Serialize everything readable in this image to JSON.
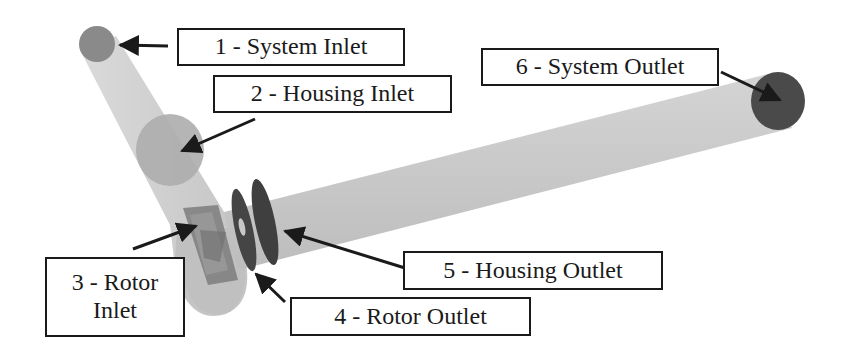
{
  "figure": {
    "type": "annotated 3D flow-domain rendering",
    "colors": {
      "background": "#ffffff",
      "pipe_fill": "#c9c9c9",
      "pipe_shadow": "#b5b5b5",
      "inlet_disc": "#8a8a8a",
      "housing_inlet_disc": "#a8a8a8",
      "outlet_disc": "#4a4a4a",
      "rotor_disc": "#3f3f3f",
      "rotor_body": "#7a7a7a",
      "label_border": "#1a1a1a",
      "label_text": "#1a1a1a",
      "arrow": "#1a1a1a"
    }
  },
  "labels": [
    {
      "id": 1,
      "text": "1 - System Inlet"
    },
    {
      "id": 2,
      "text": "2 - Housing  Inlet"
    },
    {
      "id": 3,
      "text": "3 - Rotor\nInlet"
    },
    {
      "id": 4,
      "text": "4 - Rotor Outlet"
    },
    {
      "id": 5,
      "text": "5 - Housing Outlet"
    },
    {
      "id": 6,
      "text": "6 - System Outlet"
    }
  ]
}
